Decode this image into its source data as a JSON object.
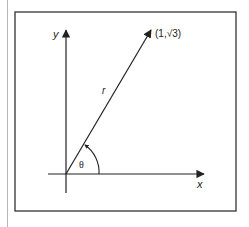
{
  "diagram": {
    "type": "polar-coordinate-figure",
    "axes": {
      "x_label": "x",
      "y_label": "y"
    },
    "vector": {
      "label": "r",
      "endpoint_label": "(1,√3)",
      "endpoint": {
        "x": 1,
        "y": "√3"
      }
    },
    "angle": {
      "label": "θ"
    },
    "colors": {
      "line": "#222222",
      "frame": "#333333",
      "background": "#ffffff"
    }
  }
}
